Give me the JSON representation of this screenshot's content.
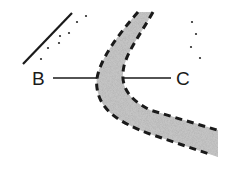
{
  "diagram": {
    "labels": {
      "left": "B",
      "right": "C"
    },
    "colors": {
      "ink": "#1a1a1a",
      "stipple_fill": "#bdbdbd",
      "background": "#ffffff"
    },
    "elements": {
      "band": "curved stippled band with dashed boundaries",
      "diagonal_line": "solid line",
      "scattered_dots": "dot pattern"
    }
  }
}
